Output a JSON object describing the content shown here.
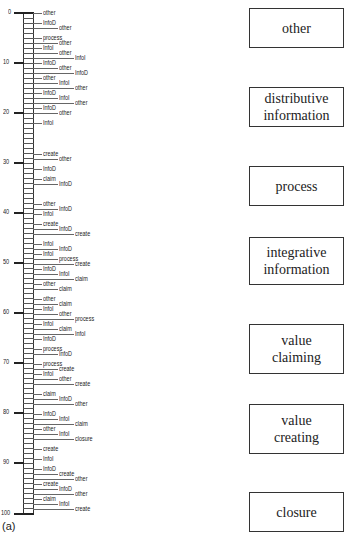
{
  "figure": {
    "caption": "(a)",
    "axis": {
      "ticks": [
        {
          "value": "0",
          "y": 13
        },
        {
          "value": "10",
          "y": 63
        },
        {
          "value": "20",
          "y": 113
        },
        {
          "value": "30",
          "y": 163
        },
        {
          "value": "40",
          "y": 213
        },
        {
          "value": "50",
          "y": 263
        },
        {
          "value": "60",
          "y": 313
        },
        {
          "value": "70",
          "y": 363
        },
        {
          "value": "80",
          "y": 413
        },
        {
          "value": "90",
          "y": 463
        },
        {
          "value": "100",
          "y": 514
        }
      ]
    },
    "leaves": [
      {
        "label": "other",
        "y": 13,
        "level": 0
      },
      {
        "label": "InfoD",
        "y": 23,
        "level": 0
      },
      {
        "label": "other",
        "y": 28,
        "level": 1
      },
      {
        "label": "process",
        "y": 38,
        "level": 0
      },
      {
        "label": "other",
        "y": 43,
        "level": 1
      },
      {
        "label": "InfoI",
        "y": 48,
        "level": 0
      },
      {
        "label": "other",
        "y": 53,
        "level": 1
      },
      {
        "label": "InfoI",
        "y": 58,
        "level": 2
      },
      {
        "label": "InfoD",
        "y": 63,
        "level": 0
      },
      {
        "label": "other",
        "y": 68,
        "level": 1
      },
      {
        "label": "InfoD",
        "y": 73,
        "level": 2
      },
      {
        "label": "other",
        "y": 78,
        "level": 0
      },
      {
        "label": "InfoI",
        "y": 83,
        "level": 1
      },
      {
        "label": "other",
        "y": 88,
        "level": 2
      },
      {
        "label": "InfoD",
        "y": 93,
        "level": 0
      },
      {
        "label": "InfoI",
        "y": 98,
        "level": 1
      },
      {
        "label": "other",
        "y": 103,
        "level": 2
      },
      {
        "label": "InfoD",
        "y": 108,
        "level": 0
      },
      {
        "label": "other",
        "y": 113,
        "level": 1
      },
      {
        "label": "InfoI",
        "y": 123,
        "level": 0
      },
      {
        "label": "create",
        "y": 154,
        "level": 0
      },
      {
        "label": "other",
        "y": 159,
        "level": 1
      },
      {
        "label": "InfoD",
        "y": 169,
        "level": 0
      },
      {
        "label": "claim",
        "y": 179,
        "level": 0
      },
      {
        "label": "InfoD",
        "y": 184,
        "level": 1
      },
      {
        "label": "other",
        "y": 204,
        "level": 0
      },
      {
        "label": "InfoD",
        "y": 209,
        "level": 1
      },
      {
        "label": "InfoI",
        "y": 214,
        "level": 0
      },
      {
        "label": "create",
        "y": 224,
        "level": 0
      },
      {
        "label": "InfoD",
        "y": 229,
        "level": 1
      },
      {
        "label": "create",
        "y": 234,
        "level": 2
      },
      {
        "label": "InfoI",
        "y": 244,
        "level": 0
      },
      {
        "label": "InfoD",
        "y": 249,
        "level": 1
      },
      {
        "label": "InfoI",
        "y": 254,
        "level": 0
      },
      {
        "label": "process",
        "y": 259,
        "level": 1
      },
      {
        "label": "create",
        "y": 264,
        "level": 2
      },
      {
        "label": "InfoD",
        "y": 269,
        "level": 0
      },
      {
        "label": "InfoI",
        "y": 274,
        "level": 1
      },
      {
        "label": "claim",
        "y": 279,
        "level": 2
      },
      {
        "label": "other",
        "y": 284,
        "level": 0
      },
      {
        "label": "claim",
        "y": 289,
        "level": 1
      },
      {
        "label": "other",
        "y": 299,
        "level": 0
      },
      {
        "label": "claim",
        "y": 304,
        "level": 1
      },
      {
        "label": "InfoI",
        "y": 309,
        "level": 0
      },
      {
        "label": "other",
        "y": 314,
        "level": 1
      },
      {
        "label": "process",
        "y": 319,
        "level": 2
      },
      {
        "label": "InfoI",
        "y": 324,
        "level": 0
      },
      {
        "label": "claim",
        "y": 329,
        "level": 1
      },
      {
        "label": "InfoI",
        "y": 334,
        "level": 2
      },
      {
        "label": "InfoD",
        "y": 339,
        "level": 0
      },
      {
        "label": "process",
        "y": 349,
        "level": 0
      },
      {
        "label": "InfoD",
        "y": 354,
        "level": 1
      },
      {
        "label": "process",
        "y": 364,
        "level": 0
      },
      {
        "label": "create",
        "y": 369,
        "level": 1
      },
      {
        "label": "InfoI",
        "y": 374,
        "level": 0
      },
      {
        "label": "other",
        "y": 379,
        "level": 1
      },
      {
        "label": "create",
        "y": 384,
        "level": 2
      },
      {
        "label": "claim",
        "y": 394,
        "level": 0
      },
      {
        "label": "InfoD",
        "y": 399,
        "level": 1
      },
      {
        "label": "other",
        "y": 404,
        "level": 2
      },
      {
        "label": "InfoD",
        "y": 414,
        "level": 0
      },
      {
        "label": "InfoI",
        "y": 419,
        "level": 1
      },
      {
        "label": "claim",
        "y": 424,
        "level": 2
      },
      {
        "label": "other",
        "y": 429,
        "level": 0
      },
      {
        "label": "InfoI",
        "y": 434,
        "level": 1
      },
      {
        "label": "closure",
        "y": 439,
        "level": 2
      },
      {
        "label": "create",
        "y": 449,
        "level": 0
      },
      {
        "label": "InfoI",
        "y": 459,
        "level": 0
      },
      {
        "label": "InfoD",
        "y": 469,
        "level": 0
      },
      {
        "label": "create",
        "y": 474,
        "level": 1
      },
      {
        "label": "other",
        "y": 479,
        "level": 2
      },
      {
        "label": "create",
        "y": 484,
        "level": 0
      },
      {
        "label": "InfoD",
        "y": 489,
        "level": 1
      },
      {
        "label": "other",
        "y": 494,
        "level": 2
      },
      {
        "label": "claim",
        "y": 499,
        "level": 0
      },
      {
        "label": "InfoI",
        "y": 504,
        "level": 1
      },
      {
        "label": "create",
        "y": 509,
        "level": 2
      }
    ]
  },
  "legend_boxes": [
    {
      "label": "other",
      "top": 8,
      "height": 40
    },
    {
      "label": "distributive information",
      "top": 87,
      "height": 40
    },
    {
      "label": "process",
      "top": 166,
      "height": 40
    },
    {
      "label": "integrative information",
      "top": 237,
      "height": 48
    },
    {
      "label": "value claiming",
      "top": 324,
      "height": 50
    },
    {
      "label": "value creating",
      "top": 404,
      "height": 50
    },
    {
      "label": "closure",
      "top": 492,
      "height": 40
    }
  ]
}
